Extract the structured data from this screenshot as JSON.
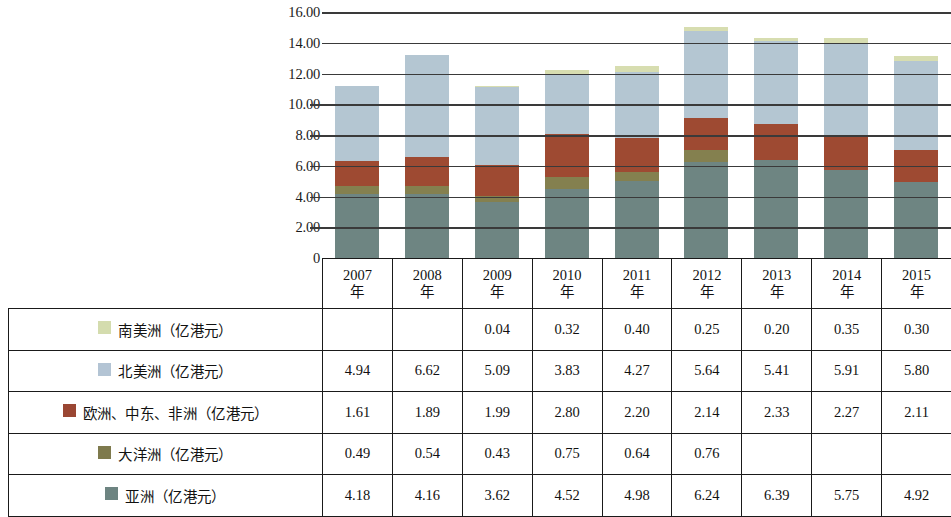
{
  "chart_data": {
    "type": "bar",
    "stacked": true,
    "title": "",
    "xlabel": "",
    "ylabel": "",
    "ylim": [
      0,
      16
    ],
    "yticks": [
      "0",
      "2.00",
      "4.00",
      "6.00",
      "8.00",
      "10.00",
      "12.00",
      "14.00",
      "16.00"
    ],
    "grid": true,
    "legend_position": "table-rows",
    "categories": [
      "2007年",
      "2008年",
      "2009年",
      "2010年",
      "2011年",
      "2012年",
      "2013年",
      "2014年",
      "2015年"
    ],
    "series": [
      {
        "name": "亚洲（亿港元）",
        "color": "#6e8582",
        "values": [
          4.18,
          4.16,
          3.62,
          4.52,
          4.98,
          6.24,
          6.39,
          5.75,
          4.92
        ]
      },
      {
        "name": "大洋洲（亿港元）",
        "color": "#84804f",
        "values": [
          0.49,
          0.54,
          0.43,
          0.75,
          0.64,
          0.76,
          null,
          null,
          null
        ]
      },
      {
        "name": "欧洲、中东、非洲（亿港元）",
        "color": "#9e4a32",
        "values": [
          1.61,
          1.89,
          1.99,
          2.8,
          2.2,
          2.14,
          2.33,
          2.27,
          2.11
        ]
      },
      {
        "name": "北美洲（亿港元）",
        "color": "#b4c6d2",
        "values": [
          4.94,
          6.62,
          5.09,
          3.83,
          4.27,
          5.64,
          5.41,
          5.91,
          5.8
        ]
      },
      {
        "name": "南美洲（亿港元）",
        "color": "#d7ddb0",
        "values": [
          null,
          null,
          0.04,
          0.32,
          0.4,
          0.25,
          0.2,
          0.35,
          0.3
        ]
      }
    ]
  },
  "axis": {
    "ticks": [
      {
        "label": "16.00",
        "value": 16
      },
      {
        "label": "14.00",
        "value": 14
      },
      {
        "label": "12.00",
        "value": 12
      },
      {
        "label": "10.00",
        "value": 10
      },
      {
        "label": "8.00",
        "value": 8
      },
      {
        "label": "6.00",
        "value": 6
      },
      {
        "label": "4.00",
        "value": 4
      },
      {
        "label": "2.00",
        "value": 2
      },
      {
        "label": "0",
        "value": 0
      }
    ]
  },
  "table": {
    "header": {
      "label_col": "",
      "years": [
        {
          "year": "2007",
          "unit": "年"
        },
        {
          "year": "2008",
          "unit": "年"
        },
        {
          "year": "2009",
          "unit": "年"
        },
        {
          "year": "2010",
          "unit": "年"
        },
        {
          "year": "2011",
          "unit": "年"
        },
        {
          "year": "2012",
          "unit": "年"
        },
        {
          "year": "2013",
          "unit": "年"
        },
        {
          "year": "2014",
          "unit": "年"
        },
        {
          "year": "2015",
          "unit": "年"
        }
      ]
    },
    "rows": [
      {
        "label": "南美洲（亿港元）",
        "swatch": "sw-samerica",
        "values": [
          "",
          "",
          "0.04",
          "0.32",
          "0.40",
          "0.25",
          "0.20",
          "0.35",
          "0.30"
        ]
      },
      {
        "label": "北美洲（亿港元）",
        "swatch": "sw-namerica",
        "values": [
          "4.94",
          "6.62",
          "5.09",
          "3.83",
          "4.27",
          "5.64",
          "5.41",
          "5.91",
          "5.80"
        ]
      },
      {
        "label": "欧洲、中东、非洲（亿港元）",
        "swatch": "sw-europe",
        "values": [
          "1.61",
          "1.89",
          "1.99",
          "2.80",
          "2.20",
          "2.14",
          "2.33",
          "2.27",
          "2.11"
        ]
      },
      {
        "label": "大洋洲（亿港元）",
        "swatch": "sw-oceania",
        "values": [
          "0.49",
          "0.54",
          "0.43",
          "0.75",
          "0.64",
          "0.76",
          "",
          "",
          ""
        ]
      },
      {
        "label": "亚洲（亿港元）",
        "swatch": "sw-asia",
        "values": [
          "4.18",
          "4.16",
          "3.62",
          "4.52",
          "4.98",
          "6.24",
          "6.39",
          "5.75",
          "4.92"
        ]
      }
    ]
  }
}
